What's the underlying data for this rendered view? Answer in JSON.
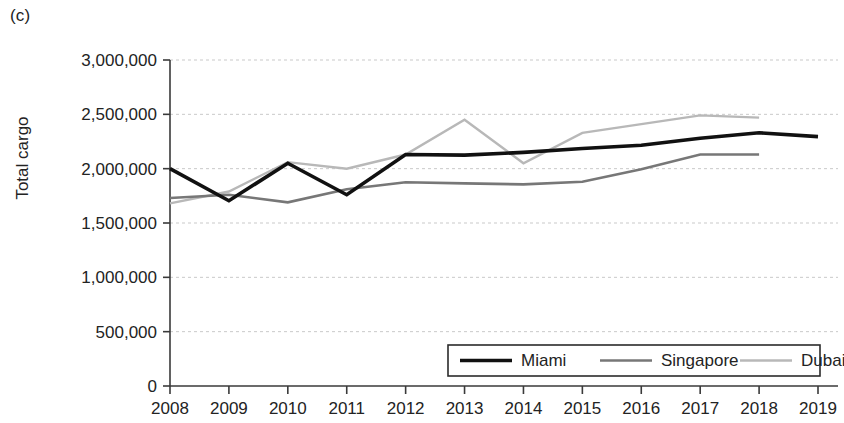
{
  "panel": {
    "label": "(c)"
  },
  "axes": {
    "y_title": "Total cargo",
    "y_ticks": [
      "0",
      "500,000",
      "1,000,000",
      "1,500,000",
      "2,000,000",
      "2,500,000",
      "3,000,000"
    ],
    "x_ticks": [
      "2008",
      "2009",
      "2010",
      "2011",
      "2012",
      "2013",
      "2014",
      "2015",
      "2016",
      "2017",
      "2018",
      "2019"
    ]
  },
  "legend": {
    "items": [
      {
        "label": "Miami",
        "color": "#111111",
        "width": 3.6
      },
      {
        "label": "Singapore",
        "color": "#777777",
        "width": 2.6
      },
      {
        "label": "Dubai",
        "color": "#b8b8b8",
        "width": 2.4
      }
    ]
  },
  "chart_data": {
    "type": "line",
    "title": "",
    "xlabel": "",
    "ylabel": "Total cargo",
    "categories": [
      2008,
      2009,
      2010,
      2011,
      2012,
      2013,
      2014,
      2015,
      2016,
      2017,
      2018,
      2019
    ],
    "xlim": [
      2008,
      2019
    ],
    "ylim": [
      0,
      3000000
    ],
    "ytick_step": 500000,
    "grid": true,
    "legend_position": "bottom-right",
    "series": [
      {
        "name": "Miami",
        "color": "#111111",
        "x": [
          2008,
          2009,
          2010,
          2011,
          2012,
          2013,
          2014,
          2015,
          2016,
          2017,
          2018,
          2019
        ],
        "values": [
          2000000,
          1705000,
          2050000,
          1760000,
          2130000,
          2125000,
          2150000,
          2185000,
          2215000,
          2280000,
          2330000,
          2295000
        ]
      },
      {
        "name": "Singapore",
        "color": "#777777",
        "x": [
          2008,
          2009,
          2010,
          2011,
          2012,
          2013,
          2014,
          2015,
          2016,
          2017,
          2018
        ],
        "values": [
          1730000,
          1760000,
          1690000,
          1810000,
          1875000,
          1865000,
          1855000,
          1880000,
          1995000,
          2130000,
          2130000
        ]
      },
      {
        "name": "Dubai",
        "color": "#b8b8b8",
        "x": [
          2008,
          2009,
          2010,
          2011,
          2012,
          2013,
          2014,
          2015,
          2016,
          2017,
          2018
        ],
        "values": [
          1680000,
          1790000,
          2060000,
          2000000,
          2130000,
          2450000,
          2050000,
          2330000,
          2410000,
          2490000,
          2470000
        ]
      }
    ]
  }
}
